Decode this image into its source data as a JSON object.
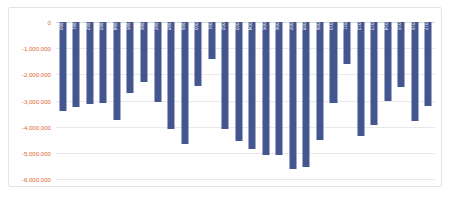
{
  "chart_data": {
    "type": "bar",
    "title": "",
    "subtitle": "",
    "xlabel": "",
    "ylabel": "",
    "orientation": "vertical",
    "grid": true,
    "legend": "none",
    "ylim": [
      -6000000,
      0
    ],
    "ytick_step": 1000000,
    "ytick_labels": [
      "0",
      "-1,000,000",
      "-2,000,000",
      "-3,000,000",
      "-4,000,000",
      "-5,000,000",
      "-6,000,000"
    ],
    "ytick_values": [
      0,
      -1000000,
      -2000000,
      -3000000,
      -4000000,
      -5000000,
      -6000000
    ],
    "categories": [
      "1990",
      "1991",
      "1992",
      "1993",
      "1994",
      "1995",
      "1996",
      "1997",
      "1998",
      "1999",
      "2000",
      "2001",
      "2002",
      "2003",
      "2004",
      "2005",
      "2006",
      "2007",
      "2008",
      "2009",
      "2010",
      "2011",
      "2012",
      "2013",
      "2014",
      "2015",
      "2016",
      "2017"
    ],
    "values": [
      -3400000,
      -3250000,
      -3150000,
      -3100000,
      -3750000,
      -2700000,
      -2300000,
      -3050000,
      -4100000,
      -4650000,
      -2450000,
      -1400000,
      -4100000,
      -4550000,
      -4850000,
      -5100000,
      -5100000,
      -5600000,
      -5550000,
      -4500000,
      -3100000,
      -1600000,
      -4350000,
      -3950000,
      -3000000,
      -2500000,
      -3800000,
      -3200000
    ],
    "series": [
      {
        "name": "Series 1",
        "color": "#44568F",
        "values": [
          -3400000,
          -3250000,
          -3150000,
          -3100000,
          -3750000,
          -2700000,
          -2300000,
          -3050000,
          -4100000,
          -4650000,
          -2450000,
          -1400000,
          -4100000,
          -4550000,
          -4850000,
          -5100000,
          -5100000,
          -5600000,
          -5550000,
          -4500000,
          -3100000,
          -1600000,
          -4350000,
          -3950000,
          -3000000,
          -2500000,
          -3800000,
          -3200000
        ]
      }
    ]
  },
  "style": {
    "bar_color": "#44568F",
    "axis_label_color": "#E06A35",
    "gridline_color": "#E9E9EC",
    "frame_color": "#E4E4E6",
    "plot_background": "#FFFFFF",
    "category_label_color": "#FFFFFF",
    "category_label_rotation": "90"
  },
  "caption": {
    "bottom_fragment": ""
  }
}
